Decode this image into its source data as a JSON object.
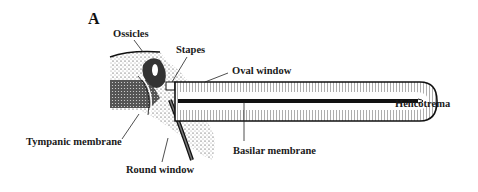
{
  "figure": {
    "panel_label": "A",
    "labels": {
      "ossicles": "Ossicles",
      "stapes": "Stapes",
      "oval_window": "Oval window",
      "helicotrema": "Helicotrema",
      "tympanic_membrane": "Tympanic membrane",
      "basilar_membrane": "Basilar membrane",
      "round_window": "Round window"
    },
    "colors": {
      "ink": "#1a1a1a",
      "background": "#ffffff"
    }
  }
}
